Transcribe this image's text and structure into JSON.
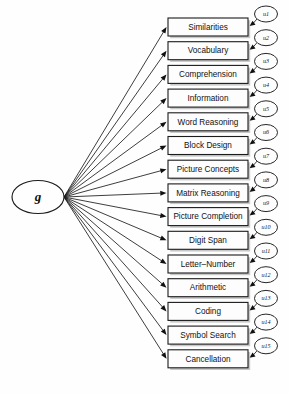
{
  "figure": {
    "type": "path-diagram",
    "title": ""
  },
  "latent": {
    "id": "g",
    "label": "g",
    "shape": "ellipse",
    "cx": 38,
    "cy": 197,
    "rx": 26,
    "ry": 16.5
  },
  "geometry": {
    "box_left": 168,
    "box_right": 248,
    "box_width": 80,
    "box_height": 18,
    "first_box_top": 18,
    "row_pitch": 23.7,
    "fan_origin_x": 64,
    "fan_origin_y": 197,
    "error_cx": 266,
    "error_rx": 11.5,
    "error_ry": 8,
    "error_dy": -13
  },
  "colors": {
    "background": "#ffffff",
    "stroke": "#1b1b1b",
    "box_fill": "#fdfdfd",
    "shadow": "#9a9a9a",
    "text": "#111111"
  },
  "indicators": [
    {
      "label": "Similarities",
      "error": "u1"
    },
    {
      "label": "Vocabulary",
      "error": "u2"
    },
    {
      "label": "Comprehension",
      "error": "u3"
    },
    {
      "label": "Information",
      "error": "u4"
    },
    {
      "label": "Word Reasoning",
      "error": "u5"
    },
    {
      "label": "Block Design",
      "error": "u6"
    },
    {
      "label": "Picture Concepts",
      "error": "u7"
    },
    {
      "label": "Matrix Reasoning",
      "error": "u8"
    },
    {
      "label": "Picture Completion",
      "error": "u9"
    },
    {
      "label": "Digit Span",
      "error": "u10"
    },
    {
      "label": "Letter–Number",
      "error": "u11"
    },
    {
      "label": "Arithmetic",
      "error": "u12"
    },
    {
      "label": "Coding",
      "error": "u13"
    },
    {
      "label": "Symbol Search",
      "error": "u14"
    },
    {
      "label": "Cancellation",
      "error": "u15"
    }
  ]
}
